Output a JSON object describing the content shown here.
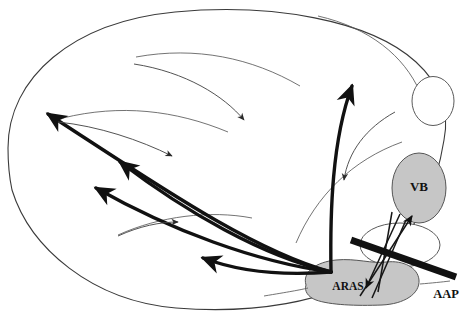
{
  "figure": {
    "type": "anatomical-schematic",
    "title": "",
    "background_color": "#ffffff",
    "stroke_color": "#111111",
    "region_fill_color": "#c6c6c6",
    "region_stroke_color": "#555555",
    "outline_color": "#3a3a3a"
  },
  "labels": {
    "aras": "ARAS",
    "vb": "VB",
    "aap": "AAP"
  },
  "regions": [
    {
      "id": "brain-outline",
      "name": "brain-outline",
      "label": "",
      "shape": "ellipse",
      "fill": "none",
      "stroke": "#3a3a3a",
      "stroke_width": 1
    },
    {
      "id": "aras",
      "name": "aras-region",
      "label": "ARAS",
      "shape": "blob",
      "fill": "#c6c6c6",
      "stroke": "#555555",
      "stroke_width": 1,
      "label_x": 348,
      "label_y": 287,
      "font_size": 11
    },
    {
      "id": "vb",
      "name": "vb-region",
      "label": "VB",
      "shape": "ellipse",
      "fill": "#c6c6c6",
      "stroke": "#555555",
      "stroke_width": 1,
      "label_x": 419,
      "label_y": 188,
      "font_size": 12
    },
    {
      "id": "mid-nucleus",
      "name": "intermediate-nucleus",
      "label": "",
      "shape": "ellipse",
      "fill": "none",
      "stroke": "#555555",
      "stroke_width": 1
    },
    {
      "id": "occipital-pole",
      "name": "occipital-ellipse",
      "label": "",
      "shape": "ellipse",
      "fill": "none",
      "stroke": "#555555",
      "stroke_width": 1
    }
  ],
  "aap_bar": {
    "name": "aap-bar",
    "label": "AAP",
    "color": "#111111",
    "thickness": 7,
    "label_x": 446,
    "label_y": 294,
    "font_size": 12
  },
  "thick_arrows": {
    "name": "aras-projection-arrows",
    "color": "#111111",
    "stroke_width": 3.4,
    "count": 5,
    "description": "Ascending projections radiating from ARAS to cortex"
  },
  "thin_arrows": {
    "name": "corticofugal-arrows",
    "color": "#555555",
    "stroke_width": 0.9,
    "count": 4,
    "description": "Descending thin arrows within cortex"
  },
  "tract_arrows": {
    "name": "aras-vb-tract-arrows",
    "color": "#222222",
    "stroke_width": 1.4,
    "count": 4,
    "description": "Bidirectional arrows between ARAS and VB crossed by AAP"
  }
}
